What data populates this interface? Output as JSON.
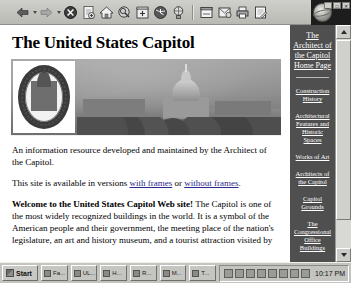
{
  "browser": {
    "toolbar": {
      "buttons": [
        {
          "name": "back-button",
          "icon": "back-arrow-icon",
          "has_caret": true
        },
        {
          "name": "forward-button",
          "icon": "forward-arrow-icon",
          "has_caret": true
        },
        {
          "name": "stop-button",
          "icon": "stop-icon",
          "has_caret": false
        },
        {
          "name": "refresh-button",
          "icon": "refresh-page-icon",
          "has_caret": false
        },
        {
          "name": "home-button",
          "icon": "home-icon",
          "has_caret": false
        },
        {
          "name": "search-button",
          "icon": "search-icon",
          "has_caret": false
        },
        {
          "name": "favorites-button",
          "icon": "favorites-folder-icon",
          "has_caret": false
        },
        {
          "name": "history-button",
          "icon": "history-clock-icon",
          "has_caret": false
        },
        {
          "name": "channels-button",
          "icon": "channels-icon",
          "has_caret": false
        },
        {
          "name": "fullscreen-button",
          "icon": "fullscreen-icon",
          "has_caret": false
        },
        {
          "name": "mail-button",
          "icon": "mail-icon",
          "has_caret": false
        },
        {
          "name": "print-button",
          "icon": "printer-icon",
          "has_caret": false
        },
        {
          "name": "edit-button",
          "icon": "edit-pencil-icon",
          "has_caret": false
        }
      ],
      "window_controls": [
        "_",
        "□",
        "✕"
      ]
    }
  },
  "page": {
    "title": "The United States Capitol",
    "banner_alt": "Photograph of the United States Capitol with the Architect of the Capitol seal",
    "paragraphs": {
      "intro": "An information resource developed and maintained by the Architect of the Capitol.",
      "frames_prefix": "This site is available in versions ",
      "frames_link_1": "with frames",
      "frames_middle": " or ",
      "frames_link_2": "without frames",
      "frames_suffix": ".",
      "welcome_lead": "Welcome to the United States Capitol Web site!",
      "welcome_body": " The Capitol is one of the most widely recognized buildings in the world. It is a symbol of the American people and their government, the meeting place of the nation's legislature, an art and history museum, and a tourist attraction visited by"
    },
    "nav": {
      "heading": "The Architect of the Capitol Home Page",
      "items": [
        "Construction History",
        "Architectural Features and Historic Spaces",
        "Works of Art",
        "Architects of the Capitol",
        "Capitol Grounds",
        "The Congressional Office Buildings",
        "U.S. Botanic Garden"
      ]
    },
    "scrollbar": {
      "up_arrow": "scroll-up",
      "down_arrow": "scroll-down"
    }
  },
  "taskbar": {
    "start_label": "Start",
    "tasks": [
      {
        "label": "Fa..."
      },
      {
        "label": "UL..."
      },
      {
        "label": "H..."
      },
      {
        "label": "R..."
      },
      {
        "label": "M..."
      },
      {
        "label": "T..."
      }
    ],
    "tray_icons": [
      "volume-icon",
      "network-icon",
      "modem-icon",
      "search-tray-icon",
      "printer-tray-icon",
      "display-icon",
      "battery-icon",
      "task-scheduler-icon"
    ],
    "clock": "10:17 PM"
  }
}
